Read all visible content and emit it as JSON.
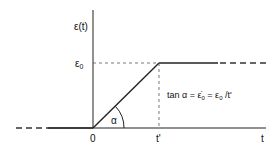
{
  "diagram": {
    "type": "ramp-strain-function",
    "y_axis_label": "ε(t)",
    "x_axis_label": "t",
    "origin_label": "0",
    "level_label": "ε",
    "level_subscript": "0",
    "time_marker_label": "t'",
    "angle_label": "α",
    "equation": {
      "prefix": "tan α = ",
      "rate_symbol": "ε̇",
      "rate_subscript": "0",
      "eq2": " = ",
      "level_symbol": "ε",
      "level_subscript": "0",
      "suffix": " /t'"
    },
    "colors": {
      "line": "#222222",
      "dashed": "#444444",
      "background": "#ffffff"
    }
  }
}
